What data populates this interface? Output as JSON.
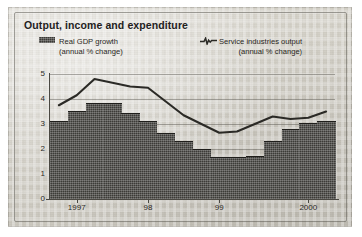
{
  "figure": {
    "title": "Output, income and expenditure"
  },
  "legend": {
    "bar": {
      "label": "Real GDP growth",
      "sublabel": "(annual % change)",
      "marker": "filled-square-swatch",
      "color": "#3c3b37"
    },
    "line": {
      "label": "Service industries output",
      "sublabel": "(annual % change)",
      "marker": "line-with-spike-marker",
      "color": "#2b2a26"
    }
  },
  "chart_data": {
    "type": "bar",
    "title": "Output, income and expenditure",
    "xlabel": "",
    "ylabel": "",
    "ylim": [
      0,
      5
    ],
    "yticks": [
      0,
      1,
      2,
      3,
      4,
      5
    ],
    "ytick_labels": [
      "0",
      "1",
      "2",
      "3",
      "4",
      "5"
    ],
    "grid": true,
    "legend_position": "top",
    "categories": [
      "1997 Q1",
      "1997 Q2",
      "1997 Q3",
      "1997 Q4",
      "1998 Q1",
      "1998 Q2",
      "1998 Q3",
      "1998 Q4",
      "1999 Q1",
      "1999 Q2",
      "1999 Q3",
      "1999 Q4",
      "2000 Q1",
      "2000 Q2",
      "2000 Q3",
      "2000 Q4"
    ],
    "xtick_labels": [
      "1997",
      "98",
      "99",
      "2000"
    ],
    "xtick_categories": [
      "1997 Q2",
      "1998 Q2",
      "1999 Q2",
      "2000 Q3"
    ],
    "series": [
      {
        "name": "Real GDP growth",
        "type": "bar",
        "unit": "annual % change",
        "values": [
          3.1,
          3.5,
          3.8,
          3.8,
          3.4,
          3.1,
          2.6,
          2.3,
          1.95,
          1.65,
          1.65,
          1.7,
          2.3,
          2.75,
          3.0,
          3.1
        ]
      },
      {
        "name": "Service industries output",
        "type": "line",
        "unit": "annual % change",
        "values": [
          3.75,
          4.15,
          4.8,
          4.65,
          4.5,
          4.45,
          3.9,
          3.35,
          3.0,
          2.65,
          2.7,
          3.0,
          3.3,
          3.2,
          3.25,
          3.5
        ]
      }
    ]
  }
}
